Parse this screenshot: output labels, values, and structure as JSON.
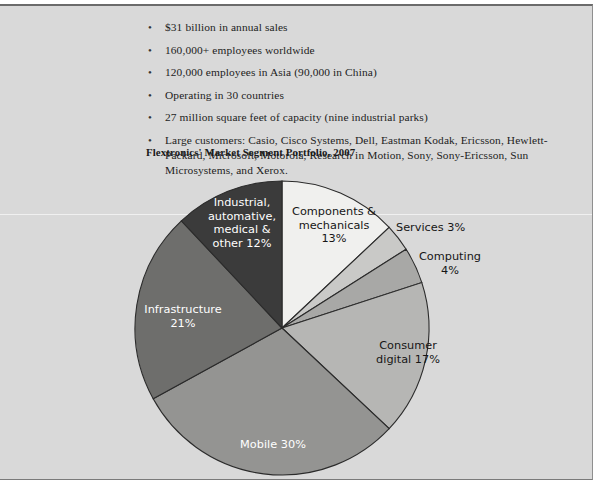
{
  "document": {
    "bullets": [
      {
        "marker": "•",
        "text": "$31 billion in annual sales"
      },
      {
        "marker": "•",
        "text": "160,000+ employees worldwide"
      },
      {
        "marker": "•",
        "text": "120,000 employees in Asia (90,000 in China)"
      },
      {
        "marker": "•",
        "text": "Operating in 30 countries"
      },
      {
        "marker": "•",
        "text": "27 million square feet of capacity (nine industrial parks)"
      },
      {
        "marker": "•",
        "text": "Large customers: Casio, Cisco Systems, Dell, Eastman Kodak, Ericsson, Hewlett-Packard, Microsoft, Motorola, Research in Motion, Sony, Sony-Ericsson, Sun Microsystems, and Xerox."
      }
    ]
  },
  "chart_data": {
    "type": "pie",
    "title": "Flextronics' Market Segment Portfolio, 2007",
    "xlabel": "",
    "ylabel": "",
    "legend_position": "none",
    "grid": false,
    "start_angle_deg": 0,
    "direction": "clockwise",
    "categories": [
      "Components & mechanicals",
      "Services",
      "Computing",
      "Consumer digital",
      "Mobile",
      "Infrastructure",
      "Industrial, automative, medical & other"
    ],
    "values": [
      13,
      3,
      4,
      17,
      30,
      21,
      12
    ],
    "colors": [
      "#f0f0ee",
      "#c9c9c7",
      "#a8a8a6",
      "#b6b6b4",
      "#949492",
      "#6e6e6c",
      "#3b3b3b"
    ],
    "slices": [
      {
        "name": "Components & mechanicals",
        "value": 13,
        "label": "Components &\nmechanicals\n13%",
        "color": "#f0f0ee",
        "label_color": "dark"
      },
      {
        "name": "Services",
        "value": 3,
        "label": "Services 3%",
        "color": "#c9c9c7",
        "label_color": "dark"
      },
      {
        "name": "Computing",
        "value": 4,
        "label": "Computing\n4%",
        "color": "#a8a8a6",
        "label_color": "dark"
      },
      {
        "name": "Consumer digital",
        "value": 17,
        "label": "Consumer\ndigital 17%",
        "color": "#b6b6b4",
        "label_color": "dark"
      },
      {
        "name": "Mobile",
        "value": 30,
        "label": "Mobile 30%",
        "color": "#949492",
        "label_color": "light"
      },
      {
        "name": "Infrastructure",
        "value": 21,
        "label": "Infrastructure\n21%",
        "color": "#6e6e6c",
        "label_color": "light"
      },
      {
        "name": "Industrial, automative, medical & other",
        "value": 12,
        "label": "Industrial,\nautomative,\nmedical &\nother 12%",
        "color": "#3b3b3b",
        "label_color": "light"
      }
    ]
  }
}
